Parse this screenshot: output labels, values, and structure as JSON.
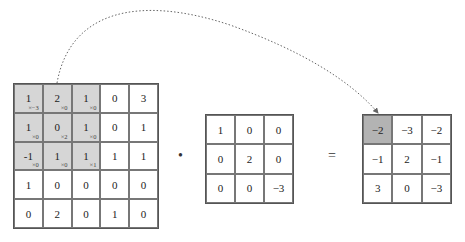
{
  "input_matrix": {
    "rows": [
      [
        "1",
        "2",
        "1",
        "0",
        "3"
      ],
      [
        "1",
        "0",
        "1",
        "0",
        "1"
      ],
      [
        "-1",
        "1",
        "1",
        "1",
        "1"
      ],
      [
        "1",
        "0",
        "0",
        "0",
        "0"
      ],
      [
        "0",
        "2",
        "0",
        "1",
        "0"
      ]
    ],
    "highlight_window": {
      "rows": [
        0,
        1,
        2
      ],
      "cols": [
        0,
        1,
        2
      ]
    },
    "weight_labels": [
      [
        "×−3",
        "×0",
        "×0"
      ],
      [
        "×0",
        "×2",
        "×0"
      ],
      [
        "×0",
        "×0",
        "×1"
      ]
    ]
  },
  "operator_multiply": "•",
  "kernel_matrix": {
    "rows": [
      [
        "1",
        "0",
        "0"
      ],
      [
        "0",
        "2",
        "0"
      ],
      [
        "0",
        "0",
        "−3"
      ]
    ]
  },
  "operator_equals": "=",
  "output_matrix": {
    "rows": [
      [
        "−2",
        "−3",
        "−2"
      ],
      [
        "−1",
        "2",
        "−1"
      ],
      [
        "3",
        "0",
        "−3"
      ]
    ],
    "highlight_cell": {
      "row": 0,
      "col": 0
    }
  },
  "colors": {
    "window_highlight": "#d6d6d6",
    "output_highlight": "#b3b3b3",
    "arrow": "#666666"
  }
}
